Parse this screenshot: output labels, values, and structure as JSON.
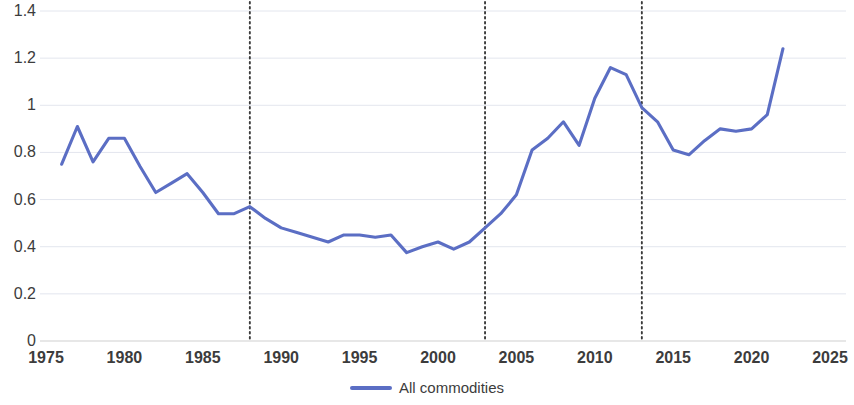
{
  "chart_data": {
    "type": "line",
    "title": "",
    "subtitle": "",
    "xlabel": "",
    "ylabel": "",
    "xlim": [
      1975,
      2025
    ],
    "ylim": [
      0,
      1.4
    ],
    "grid": true,
    "legend_position": "bottom",
    "x_ticks": [
      "1975",
      "1980",
      "1985",
      "1990",
      "1995",
      "2000",
      "2005",
      "2010",
      "2015",
      "2020",
      "2025"
    ],
    "y_ticks": [
      "0",
      "0.2",
      "0.4",
      "0.6",
      "0.8",
      "1",
      "1.2",
      "1.4"
    ],
    "series": [
      {
        "name": "All commodities",
        "color": "#5b6ec4",
        "x": [
          1976,
          1977,
          1978,
          1979,
          1980,
          1981,
          1982,
          1983,
          1984,
          1985,
          1986,
          1987,
          1988,
          1989,
          1990,
          1991,
          1992,
          1993,
          1994,
          1995,
          1996,
          1997,
          1998,
          1999,
          2000,
          2001,
          2002,
          2003,
          2004,
          2005,
          2006,
          2007,
          2008,
          2009,
          2010,
          2011,
          2012,
          2013,
          2014,
          2015,
          2016,
          2017,
          2018,
          2019,
          2020,
          2021,
          2022
        ],
        "values": [
          0.75,
          0.91,
          0.76,
          0.86,
          0.86,
          0.74,
          0.63,
          0.67,
          0.71,
          0.63,
          0.54,
          0.54,
          0.57,
          0.52,
          0.48,
          0.46,
          0.44,
          0.42,
          0.45,
          0.45,
          0.44,
          0.45,
          0.375,
          0.4,
          0.42,
          0.39,
          0.42,
          0.48,
          0.54,
          0.62,
          0.81,
          0.86,
          0.93,
          0.83,
          1.03,
          1.16,
          1.13,
          0.99,
          0.93,
          0.81,
          0.79,
          0.85,
          0.9,
          0.89,
          0.9,
          0.96,
          1.24
        ]
      }
    ],
    "annotations": [
      {
        "type": "vertical-dotted-line",
        "x": 1988
      },
      {
        "type": "vertical-dotted-line",
        "x": 2003
      },
      {
        "type": "vertical-dotted-line",
        "x": 2013
      }
    ]
  },
  "legend": {
    "label": "All commodities"
  }
}
